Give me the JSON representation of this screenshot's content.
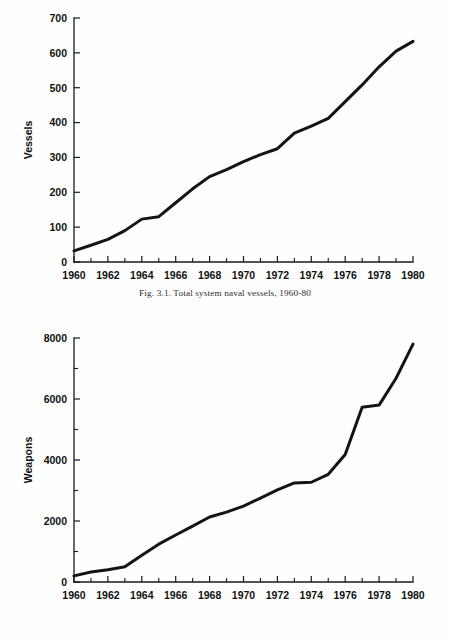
{
  "page": {
    "background_color": "#fefefe",
    "ink_color": "#141414"
  },
  "figures": [
    {
      "id": "fig-3-1",
      "caption": "Fig. 3.1. Total system naval vessels, 1960-80",
      "chart_data": {
        "type": "line",
        "title": "",
        "xlabel": "",
        "ylabel": "Vessels",
        "xlim": [
          1960,
          1980
        ],
        "ylim": [
          0,
          700
        ],
        "grid": false,
        "legend": null,
        "x_tick_labels": [
          "1960",
          "1962",
          "1964",
          "1966",
          "1968",
          "1970",
          "1972",
          "1974",
          "1976",
          "1978",
          "1980"
        ],
        "x_tick_values": [
          1960,
          1962,
          1964,
          1966,
          1968,
          1970,
          1972,
          1974,
          1976,
          1978,
          1980
        ],
        "x_minor_tick_values": [
          1961,
          1963,
          1965,
          1967,
          1969,
          1971,
          1973,
          1975,
          1977,
          1979
        ],
        "y_tick_labels": [
          "0",
          "100",
          "200",
          "300",
          "400",
          "500",
          "600",
          "700"
        ],
        "y_tick_values": [
          0,
          100,
          200,
          300,
          400,
          500,
          600,
          700
        ],
        "x": [
          1960,
          1961,
          1962,
          1963,
          1964,
          1965,
          1966,
          1967,
          1968,
          1969,
          1970,
          1971,
          1972,
          1973,
          1974,
          1975,
          1976,
          1977,
          1978,
          1979
        ],
        "series": [
          {
            "name": "Total system naval vessels",
            "values": [
              32,
              48,
              65,
              90,
              123,
              130,
              170,
              210,
              245,
              265,
              288,
              308,
              325,
              370,
              390,
              412,
              460,
              508,
              560,
              605,
              633
            ]
          }
        ]
      }
    },
    {
      "id": "fig-3-2",
      "caption": "Fig. 3.2. Total system land weapons, 1960-80",
      "chart_data": {
        "type": "line",
        "title": "",
        "xlabel": "",
        "ylabel": "Weapons",
        "xlim": [
          1960,
          1980
        ],
        "ylim": [
          0,
          8000
        ],
        "grid": false,
        "legend": null,
        "x_tick_labels": [
          "1960",
          "1962",
          "1964",
          "1966",
          "1968",
          "1970",
          "1972",
          "1974",
          "1976",
          "1978",
          "1980"
        ],
        "x_tick_values": [
          1960,
          1962,
          1964,
          1966,
          1968,
          1970,
          1972,
          1974,
          1976,
          1978,
          1980
        ],
        "x_minor_tick_values": [
          1961,
          1963,
          1965,
          1967,
          1969,
          1971,
          1973,
          1975,
          1977,
          1979
        ],
        "y_tick_labels": [
          "0",
          "2000",
          "4000",
          "6000",
          "8000"
        ],
        "y_tick_values": [
          0,
          2000,
          4000,
          6000,
          8000
        ],
        "y_minor_tick_values": [
          1000,
          3000,
          5000,
          7000
        ],
        "x": [
          1960,
          1961,
          1962,
          1963,
          1964,
          1965,
          1966,
          1967,
          1968,
          1969,
          1970,
          1971,
          1972,
          1973,
          1974,
          1975,
          1976,
          1977,
          1978,
          1979,
          1980
        ],
        "series": [
          {
            "name": "Total system land weapons",
            "values": [
              200,
              330,
              400,
              500,
              880,
              1240,
              1540,
              1830,
              2130,
              2290,
              2490,
              2750,
              3020,
              3250,
              3270,
              3530,
              4180,
              5730,
              5800,
              6680,
              7800
            ]
          }
        ]
      }
    }
  ]
}
